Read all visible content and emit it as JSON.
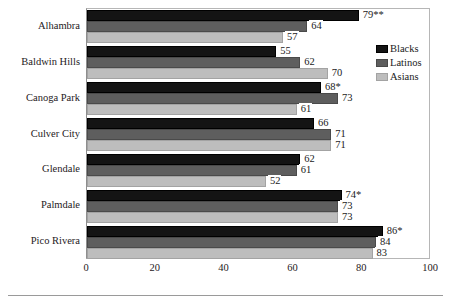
{
  "chart_data": {
    "type": "bar",
    "orientation": "horizontal",
    "title": "",
    "subtitle": "",
    "xlabel": "",
    "ylabel": "",
    "xlim": [
      0,
      100
    ],
    "xticks": [
      0,
      20,
      40,
      60,
      80,
      100
    ],
    "xtick_labels": [
      "0",
      "20",
      "40",
      "60",
      "80",
      "100"
    ],
    "grid": false,
    "legend_position": "upper right (inside plot area)",
    "categories": [
      "Alhambra",
      "Baldwin Hills",
      "Canoga Park",
      "Culver City",
      "Glendale",
      "Palmdale",
      "Pico Rivera"
    ],
    "series": [
      {
        "name": "Blacks",
        "color": "#141414",
        "values": [
          79,
          55,
          68,
          66,
          62,
          74,
          86
        ],
        "labels": [
          "79**",
          "55",
          "68*",
          "66",
          "62",
          "74*",
          "86*"
        ]
      },
      {
        "name": "Latinos",
        "color": "#5e5e5e",
        "values": [
          64,
          62,
          73,
          71,
          61,
          73,
          84
        ],
        "labels": [
          "64",
          "62",
          "73",
          "71",
          "61",
          "73",
          "84"
        ]
      },
      {
        "name": "Asians",
        "color": "#bdbdbd",
        "values": [
          57,
          70,
          61,
          71,
          52,
          73,
          83
        ],
        "labels": [
          "57",
          "70",
          "61",
          "71",
          "52",
          "73",
          "83"
        ]
      }
    ]
  }
}
